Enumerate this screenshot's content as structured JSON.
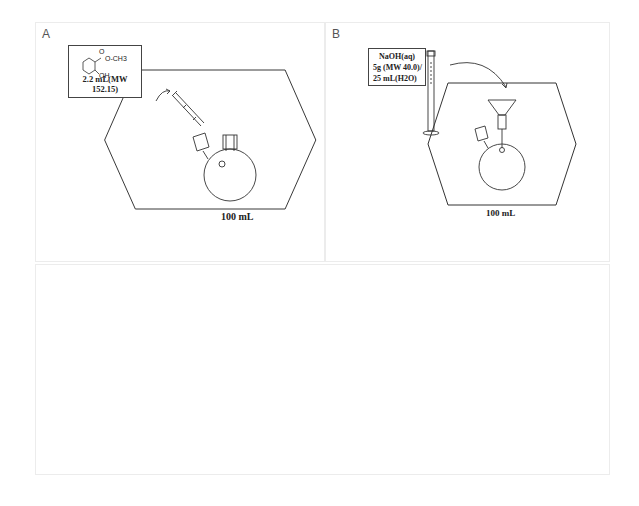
{
  "panels": {
    "A": {
      "label": "A",
      "reagent": {
        "structure": "methyl salicylate",
        "ester_group": "O-CH3",
        "carbonyl_o": "O",
        "hydroxyl": "OH",
        "amount": "2.2 mL(MW 152.15)"
      },
      "flask_volume": "100 mL",
      "apparatus": [
        "syringe",
        "two-neck round-bottom flask",
        "stir bar"
      ]
    },
    "B": {
      "label": "B",
      "reagent": {
        "line1": "NaOH(aq)",
        "line2": "5g (MW 40.0)/",
        "line3": "25 mL(H2O)"
      },
      "flask_volume": "100 mL",
      "apparatus": [
        "graduated cylinder",
        "funnel",
        "two-neck round-bottom flask",
        "stir bar"
      ]
    },
    "C": {
      "label": ""
    }
  },
  "colors": {
    "line": "#333333",
    "panel_border": "#ececec",
    "label": "#555555"
  }
}
